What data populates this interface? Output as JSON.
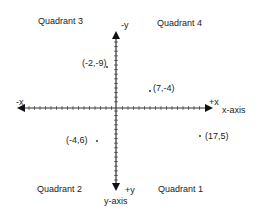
{
  "diagram": {
    "quadrants": {
      "q3": "Quadrant 3",
      "q4": "Quadrant 4",
      "q2": "Quadrant 2",
      "q1": "Quadrant 1"
    },
    "axes": {
      "neg_y": "-y",
      "pos_y": "+y",
      "y_axis": "y-axis",
      "neg_x": "-x",
      "pos_x": "+x",
      "x_axis": "x-axis"
    },
    "points": [
      {
        "label": "(-2,-9)",
        "x": -2,
        "y": -9
      },
      {
        "label": "(7,-4)",
        "x": 7,
        "y": -4
      },
      {
        "label": "(-4,6)",
        "x": -4,
        "y": 6
      },
      {
        "label": "(17,5)",
        "x": 17,
        "y": 5
      }
    ],
    "colors": {
      "axis": "#333333",
      "text": "#222222",
      "background": "#ffffff"
    }
  }
}
